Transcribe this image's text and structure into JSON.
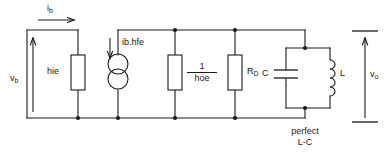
{
  "diagram": {
    "stroke_color": "#1a1a1a",
    "background_color": "#ffffff",
    "labels": {
      "input_current": "i",
      "input_current_sub": "b",
      "input_voltage": "v",
      "input_voltage_sub": "b",
      "input_resistance": "hie",
      "current_source": "ib.hfe",
      "output_conductance_num": "1",
      "output_conductance_den": "hoe",
      "drain_resistor": "R",
      "drain_resistor_sub": "D",
      "capacitor": "C",
      "inductor": "L",
      "output_voltage": "v",
      "output_voltage_sub": "o",
      "tank_note_line1": "perfect",
      "tank_note_line2": "L-C"
    }
  }
}
